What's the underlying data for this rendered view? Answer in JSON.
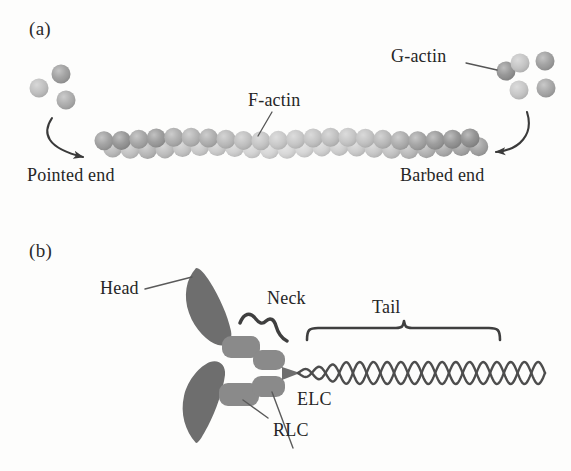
{
  "figure": {
    "background_color": "#fdfdfc",
    "text_color": "#262626"
  },
  "panel_a": {
    "label": "(a)",
    "subject": "actin filament polymerization",
    "labels": {
      "g_actin": "G-actin",
      "f_actin": "F-actin",
      "pointed_end": "Pointed end",
      "barbed_end": "Barbed end"
    },
    "palette": {
      "bead_dark": "#8c8c8c",
      "bead_mid": "#a3a3a3",
      "bead_light": "#bdbdbd",
      "bead_lightest": "#cfcfcf",
      "arrow": "#3a3a3a",
      "leader": "#555555"
    },
    "filament": {
      "bead_count_per_row": 22,
      "rows": 2,
      "bead_radius": 9.5,
      "start_x": 104,
      "end_x": 470,
      "row_top_y": 139,
      "row_bottom_y": 148,
      "row_top_shades": [
        "#9a9a9a",
        "#8f8f8f",
        "#a0a0a0",
        "#969696",
        "#a8a8a8",
        "#b0b0b0",
        "#aaaaaa",
        "#b6b6b6",
        "#bcbcbc",
        "#c2c2c2",
        "#c6c6c6",
        "#c4c4c4",
        "#c0c0c0",
        "#bdbdbd",
        "#c3c3c3",
        "#bfbfbf",
        "#b4b4b4",
        "#a9a9a9",
        "#9e9e9e",
        "#949494",
        "#8d8d8d",
        "#8a8a8a"
      ],
      "row_bottom_shades": [
        "#b8b8b8",
        "#c0c0c0",
        "#b4b4b4",
        "#bcbcbc",
        "#c2c2c2",
        "#c8c8c8",
        "#cacaca",
        "#cecece",
        "#d2d2d2",
        "#d4d4d4",
        "#d6d6d6",
        "#d4d4d4",
        "#d0d0d0",
        "#cdcdcd",
        "#cacaca",
        "#c6c6c6",
        "#c0c0c0",
        "#b8b8b8",
        "#b0b0b0",
        "#a8a8a8",
        "#a2a2a2",
        "#9e9e9e"
      ]
    },
    "free_monomers_left": [
      {
        "cx": 39,
        "cy": 88,
        "r": 9.5,
        "fill": "#bcbcbc"
      },
      {
        "cx": 61,
        "cy": 74,
        "r": 9.5,
        "fill": "#9a9a9a"
      },
      {
        "cx": 66,
        "cy": 100,
        "r": 9.5,
        "fill": "#a8a8a8"
      }
    ],
    "free_monomers_right": [
      {
        "cx": 506,
        "cy": 71,
        "r": 9.5,
        "fill": "#8e8e8e"
      },
      {
        "cx": 520,
        "cy": 63,
        "r": 9.5,
        "fill": "#c2c2c2"
      },
      {
        "cx": 545,
        "cy": 61,
        "r": 9.5,
        "fill": "#9a9a9a"
      },
      {
        "cx": 519,
        "cy": 90,
        "r": 9.5,
        "fill": "#c4c4c4"
      },
      {
        "cx": 546,
        "cy": 88,
        "r": 9.5,
        "fill": "#a2a2a2"
      }
    ]
  },
  "panel_b": {
    "label": "(b)",
    "subject": "myosin II molecule",
    "labels": {
      "head": "Head",
      "neck": "Neck",
      "tail": "Tail",
      "elc": "ELC",
      "rlc": "RLC"
    },
    "palette": {
      "head_fill": "#6e6e6e",
      "light_chain_fill": "#8a8a8a",
      "tail_stroke": "#4d4d4d",
      "bracket_stroke": "#3f3f3f",
      "leader": "#5a5a5a"
    },
    "structure": {
      "heads": 2,
      "light_chains_per_head": 2,
      "tail_type": "coiled-coil",
      "tail_turns": 9
    }
  }
}
